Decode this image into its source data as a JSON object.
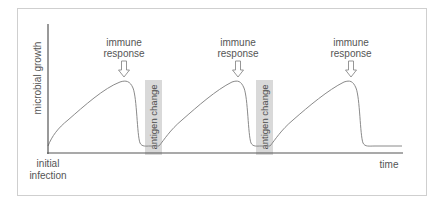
{
  "diagram": {
    "y_axis_label": "microbial growth",
    "x_axis_label": "time",
    "origin_label_line1": "initial",
    "origin_label_line2": "infection",
    "peaks": [
      {
        "label_line1": "immune",
        "label_line2": "response"
      },
      {
        "label_line1": "immune",
        "label_line2": "response"
      },
      {
        "label_line1": "immune",
        "label_line2": "response"
      }
    ],
    "bands": [
      {
        "label": "antigen change"
      },
      {
        "label": "antigen change"
      }
    ],
    "colors": {
      "frame": "#cfcfcf",
      "axis": "#555555",
      "curve": "#8a8a8a",
      "band": "#d9d9d9",
      "text": "#555555"
    }
  }
}
